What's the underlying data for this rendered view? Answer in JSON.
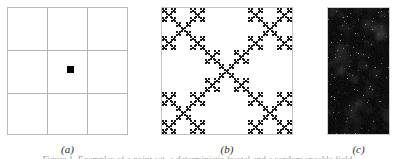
{
  "figure": {
    "panel_count": 3,
    "background_color": "#ffffff",
    "cropped_caption_text": "Figure 1. Examples of a point set, a deterministic fractal and a random speckle field."
  },
  "panels": [
    {
      "id": "a",
      "label": "(a)",
      "kind": "grid-with-point",
      "description": "3 by 3 square grid with a single small filled square at the centre cell",
      "grid_rows": 3,
      "grid_cols": 3,
      "line_color": "#b4b4b4",
      "border_color": "#b9b9b9",
      "point_color": "#000000",
      "point_count": 1,
      "point_size_px": 7
    },
    {
      "id": "b",
      "label": "(b)",
      "kind": "fractal",
      "description": "Deterministic X-shaped (diagonal Vicsek) fractal, four iterations of a 3 by 3 subdivision keeping the four corners and the centre",
      "base": 3,
      "iterations": 4,
      "kept_cells": [
        [
          0,
          0
        ],
        [
          0,
          2
        ],
        [
          1,
          1
        ],
        [
          2,
          0
        ],
        [
          2,
          2
        ]
      ],
      "fill_color": "#1a1a1a",
      "background_color": "#ffffff",
      "border_color": "#c2c2c2"
    },
    {
      "id": "c",
      "label": "(c)",
      "kind": "speckle-noise",
      "description": "Dark random speckle field with sparse brighter grains",
      "base_color": "#080808",
      "speckle_color": "#b9b9b9",
      "mean_level": 14,
      "noise_amplitude": 18,
      "bright_speckle_fraction": 0.012,
      "border_color": "#cfcfcf"
    }
  ]
}
